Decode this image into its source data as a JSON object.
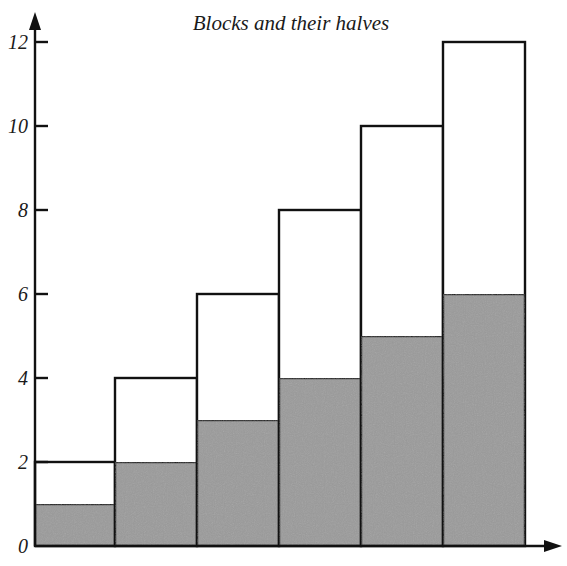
{
  "chart_data": {
    "type": "bar",
    "title": "Blocks and their halves",
    "xlabel": "",
    "ylabel": "",
    "ylim": [
      0,
      12
    ],
    "yticks": [
      0,
      2,
      4,
      6,
      8,
      10,
      12
    ],
    "grid": false,
    "legend": null,
    "categories": [
      "1",
      "2",
      "3",
      "4",
      "5",
      "6"
    ],
    "series": [
      {
        "name": "Block",
        "values": [
          2,
          4,
          6,
          8,
          10,
          12
        ],
        "fill": "#ffffff"
      },
      {
        "name": "Half",
        "values": [
          1,
          2,
          3,
          4,
          5,
          6
        ],
        "fill": "#9a9a9a"
      }
    ],
    "colors": {
      "axis": "#111111",
      "half_fill": "#9a9a9a",
      "block_fill": "#ffffff"
    }
  }
}
